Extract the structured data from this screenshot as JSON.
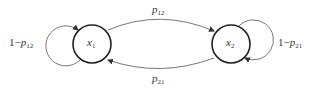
{
  "diagram": {
    "type": "markov-chain",
    "nodes": [
      {
        "id": "x1",
        "base": "x",
        "sub": "1"
      },
      {
        "id": "x2",
        "base": "x",
        "sub": "2"
      }
    ],
    "edges": [
      {
        "from": "x1",
        "to": "x2",
        "label_base": "p",
        "label_sub": "12"
      },
      {
        "from": "x2",
        "to": "x1",
        "label_base": "p",
        "label_sub": "21"
      },
      {
        "from": "x1",
        "to": "x1",
        "label_prefix": "1−",
        "label_base": "p",
        "label_sub": "12"
      },
      {
        "from": "x2",
        "to": "x2",
        "label_prefix": "1−",
        "label_base": "p",
        "label_sub": "21"
      }
    ],
    "colors": {
      "node_stroke": "#222222",
      "edge_stroke": "#777777",
      "text": "#333333"
    }
  }
}
